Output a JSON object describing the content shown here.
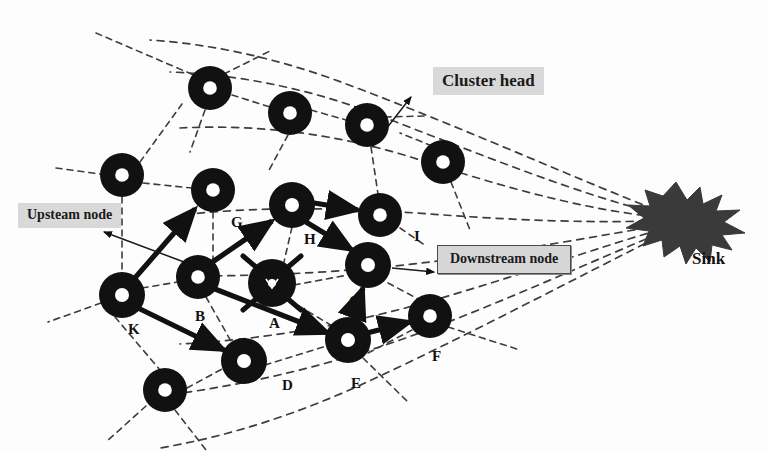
{
  "figure": {
    "type": "network-topology-diagram",
    "background_color": "#fdfdfd",
    "node_color": "#111111",
    "sink_color": "#3a3a3a",
    "callout_fill": "#d9d9d9",
    "width": 768,
    "height": 451
  },
  "callouts": [
    {
      "id": "cluster-head",
      "label": "Cluster head",
      "style": "plain",
      "x": 433,
      "y": 67,
      "font_size": 17
    },
    {
      "id": "upstream-node",
      "label": "Upsteam node",
      "style": "plain",
      "x": 18,
      "y": 203,
      "font_size": 14
    },
    {
      "id": "downstream-node",
      "label": "Downstream node",
      "style": "boxed",
      "x": 437,
      "y": 245,
      "font_size": 14
    }
  ],
  "sink": {
    "label": "Sink",
    "label_x": 692,
    "label_y": 249,
    "center_x": 676,
    "center_y": 222
  },
  "nodes": [
    {
      "id": "n-top-1",
      "label": "",
      "x": 210,
      "y": 88,
      "kind": "ring",
      "label_dx": 0,
      "label_dy": 0
    },
    {
      "id": "n-top-2",
      "label": "",
      "x": 290,
      "y": 113,
      "kind": "ring",
      "label_dx": 0,
      "label_dy": 0
    },
    {
      "id": "n-top-3",
      "label": "",
      "x": 367,
      "y": 125,
      "kind": "ring",
      "label_dx": 0,
      "label_dy": 0
    },
    {
      "id": "n-left-1",
      "label": "",
      "x": 122,
      "y": 175,
      "kind": "ring",
      "label_dx": 0,
      "label_dy": 0
    },
    {
      "id": "n-right-1",
      "label": "",
      "x": 443,
      "y": 162,
      "kind": "ring",
      "label_dx": 0,
      "label_dy": 0
    },
    {
      "id": "n-G",
      "label": "G",
      "x": 213,
      "y": 190,
      "kind": "ring",
      "label_dx": 18,
      "label_dy": 36
    },
    {
      "id": "n-H",
      "label": "H",
      "x": 292,
      "y": 205,
      "kind": "ring",
      "label_dx": 15,
      "label_dy": 38
    },
    {
      "id": "n-I",
      "label": "I",
      "x": 380,
      "y": 215,
      "kind": "ring",
      "label_dx": 37,
      "label_dy": 24
    },
    {
      "id": "n-K",
      "label": "K",
      "x": 122,
      "y": 295,
      "kind": "ring",
      "label_dx": 9,
      "label_dy": 37
    },
    {
      "id": "n-B",
      "label": "B",
      "x": 198,
      "y": 277,
      "kind": "ring",
      "label_dx": 0,
      "label_dy": 42
    },
    {
      "id": "n-A",
      "label": "A",
      "x": 272,
      "y": 283,
      "kind": "cluster-head",
      "label_dx": 1,
      "label_dy": 43
    },
    {
      "id": "n-C",
      "label": "C",
      "x": 368,
      "y": 265,
      "kind": "ring",
      "label_dx": -17,
      "label_dy": 37
    },
    {
      "id": "n-D",
      "label": "D",
      "x": 244,
      "y": 361,
      "kind": "ring",
      "label_dx": 40,
      "label_dy": 26
    },
    {
      "id": "n-E",
      "label": "E",
      "x": 348,
      "y": 340,
      "kind": "ring",
      "label_dx": 5,
      "label_dy": 44
    },
    {
      "id": "n-F",
      "label": "F",
      "x": 430,
      "y": 316,
      "kind": "ring",
      "label_dx": 4,
      "label_dy": 43
    },
    {
      "id": "n-bot-1",
      "label": "",
      "x": 165,
      "y": 390,
      "kind": "ring",
      "label_dx": 0,
      "label_dy": 0
    }
  ],
  "routing_arrows": [
    {
      "from": "n-K",
      "to": "n-G",
      "label": "K to G"
    },
    {
      "from": "n-B",
      "to": "n-H",
      "label": "B to H"
    },
    {
      "from": "n-K",
      "to": "n-D",
      "label": "K to D"
    },
    {
      "from": "n-B",
      "to": "n-E",
      "label": "B to E"
    },
    {
      "from": "n-H",
      "to": "n-I",
      "label": "H to I"
    },
    {
      "from": "n-H",
      "to": "n-C",
      "label": "H to C"
    },
    {
      "from": "n-E",
      "to": "n-C",
      "label": "E to C"
    },
    {
      "from": "n-E",
      "to": "n-F",
      "label": "E to F"
    }
  ],
  "pointer_arrows": [
    {
      "id": "cluster-head-pointer",
      "label": "points from cluster head node A area to Cluster head callout"
    },
    {
      "id": "upstream-pointer",
      "label": "points to Upsteam node callout"
    },
    {
      "id": "downstream-pointer",
      "label": "points from node C to Downstream node callout"
    }
  ]
}
